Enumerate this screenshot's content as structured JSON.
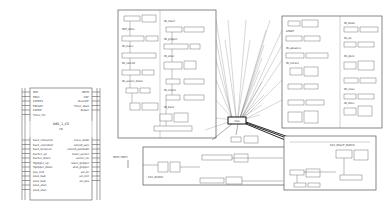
{
  "fb_block": {
    "name": "DB1_1_CS",
    "type": "CB",
    "inputs_top": [
      "INIT",
      "PRE1",
      "ESTOP1",
      "PRESET",
      "ESTOP",
      "Timer_Fin"
    ],
    "outputs_top": [
      "INITO",
      "CNF",
      "ResetOF",
      "Timer_Start",
      "Repair"
    ],
    "inputs_bottom": [
      "back_retracted",
      "back_extended",
      "back_between",
      "bucher_up",
      "bucher_down",
      "flgripper_up",
      "flgripper_down",
      "pos_mid",
      "pos1_bad",
      "pos2_bad",
      "pos3_shut",
      "pos4_shut"
    ],
    "outputs_bottom": [
      "move_disbt",
      "extend_jack",
      "extend_jackdisbt",
      "lower_sucker",
      "sucker_on",
      "lower_gripper",
      "shut_gripper",
      "sol_on",
      "sol_on2",
      "sol_pos"
    ]
  },
  "ecc_left": {
    "states": [
      "INIT_done",
      "IN_move",
      "IN_extend",
      "IN_sucker_down",
      "IN_lower",
      "IN_gripper",
      "IN_shut",
      "IN_return",
      "IN_back"
    ],
    "actions": [
      "Setup_init",
      "Setup_move",
      "Setup_extend",
      "Setup_lower",
      "Setup_pick"
    ]
  },
  "ecc_right": {
    "states": [
      "START",
      "IN_advance",
      "IN_retract",
      "IN_down",
      "IN_up",
      "IN_open",
      "IN_close",
      "IN_done"
    ]
  },
  "hub": {
    "label": "CS1"
  },
  "bottom_left": {
    "label": "INIT1 [INIT]"
  },
  "bottom_center": {
    "label": "ECC_BLOCK"
  },
  "bottom_right": {
    "label": "ECC_RIGHT_BLOCK"
  }
}
